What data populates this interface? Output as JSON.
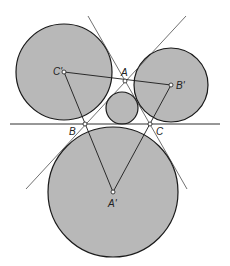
{
  "diagram": {
    "fill_color": "#b8b8b8",
    "stroke_color": "#1a1a1a",
    "labels": {
      "A": "A",
      "B": "B",
      "C": "C",
      "A_prime": "A'",
      "B_prime": "B'",
      "C_prime": "C'"
    }
  }
}
